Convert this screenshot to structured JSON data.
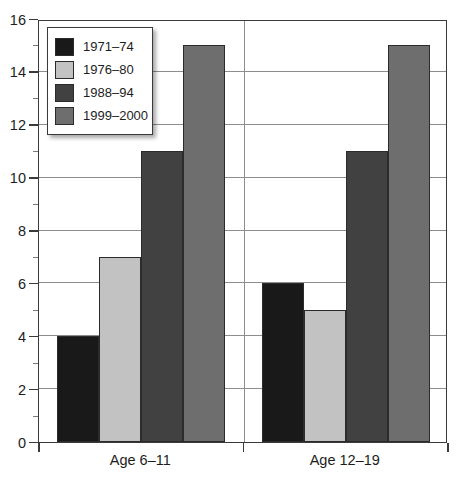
{
  "chart_data": {
    "type": "bar",
    "title": "",
    "xlabel": "",
    "ylabel": "",
    "categories": [
      "Age 6–11",
      "Age 12–19"
    ],
    "series": [
      {
        "name": "1971–74",
        "color": "#191919",
        "values": [
          4,
          6
        ]
      },
      {
        "name": "1976–80",
        "color": "#c2c2c2",
        "values": [
          7,
          5
        ]
      },
      {
        "name": "1988–94",
        "color": "#414141",
        "values": [
          11,
          11
        ]
      },
      {
        "name": "1999–2000",
        "color": "#6e6e6e",
        "values": [
          15,
          15
        ]
      }
    ],
    "ylim": [
      0,
      16
    ],
    "y_major_ticks": [
      0,
      2,
      4,
      6,
      8,
      10,
      12,
      14,
      16
    ],
    "y_minor_ticks": [
      1,
      3,
      5,
      7,
      9,
      11,
      13,
      15
    ],
    "y_tick_labels": [
      "0",
      "2",
      "4",
      "6",
      "8",
      "10",
      "12",
      "14",
      "16"
    ],
    "grid": true,
    "grid_axis": "y",
    "legend_position": "upper left"
  },
  "colors": {
    "axis": "#3a3a3a",
    "grid": "#8d8d8d",
    "text": "#1d1d1d",
    "background": "#ffffff",
    "bar_outline": "#2b2b2b"
  }
}
